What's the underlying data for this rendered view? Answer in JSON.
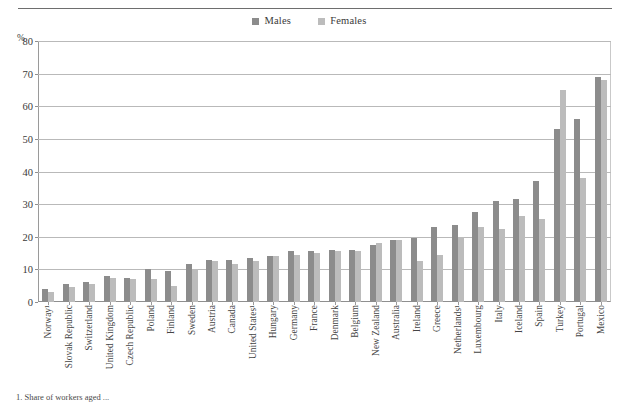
{
  "figure": {
    "y_unit_label": "%",
    "footnote": "1. Share of workers aged ..."
  },
  "legend": {
    "position": "top-center",
    "entries": [
      {
        "label": "Males",
        "color": "#8c8c8c",
        "swatch": "square-swatch"
      },
      {
        "label": "Females",
        "color": "#bcbcbc",
        "swatch": "square-swatch"
      }
    ]
  },
  "axis": {
    "y_ticks": [
      0,
      10,
      20,
      30,
      40,
      50,
      60,
      70,
      80
    ],
    "y_min": 0,
    "y_max": 80,
    "grid": true
  },
  "chart_data": {
    "type": "bar",
    "title": "",
    "subtitle": "",
    "xlabel": "",
    "ylabel": "%",
    "ylim": [
      0,
      80
    ],
    "grid": true,
    "legend_position": "top-center",
    "categories": [
      "Norway¹",
      "Slovak Republic",
      "Switzerland",
      "United Kingdom",
      "Czech Republic",
      "Poland",
      "Finland",
      "Sweden",
      "Austria",
      "Canada",
      "United States¹",
      "Hungary",
      "Germany",
      "France",
      "Denmark",
      "Belgium",
      "New Zealand",
      "Australia",
      "Ireland",
      "Greece",
      "Netherlands¹",
      "Luxembourg",
      "Italy",
      "Iceland",
      "Spain",
      "Turkey",
      "Portugal",
      "Mexico"
    ],
    "series": [
      {
        "name": "Males",
        "color": "#8c8c8c",
        "values": [
          4,
          5.5,
          6,
          8,
          7.5,
          10,
          9.5,
          11.5,
          13,
          13,
          13.5,
          14,
          15.5,
          15.5,
          16,
          16,
          17.5,
          19,
          19.5,
          23,
          23.5,
          27.5,
          31,
          31.5,
          37,
          53,
          56,
          69
        ]
      },
      {
        "name": "Females",
        "color": "#bcbcbc",
        "values": [
          3,
          4.5,
          5.5,
          7.5,
          7,
          7,
          5,
          10,
          12.5,
          11.5,
          12.5,
          14,
          14.5,
          15,
          15.5,
          15.5,
          18,
          19,
          12.5,
          14.5,
          20,
          23,
          22.5,
          26.5,
          25.5,
          65,
          38,
          68
        ]
      }
    ]
  }
}
